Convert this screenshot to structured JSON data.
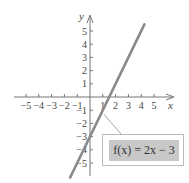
{
  "chart_data": {
    "type": "line",
    "title": "",
    "xlabel": "x",
    "ylabel": "y",
    "xlim": [
      -5.8,
      6
    ],
    "ylim": [
      -6.2,
      6.2
    ],
    "x_ticks": [
      -5,
      -4,
      -3,
      -2,
      -1,
      1,
      2,
      3,
      4,
      5
    ],
    "y_ticks": [
      5,
      4,
      3,
      2,
      1,
      -1,
      -2,
      -3,
      -4,
      -5
    ],
    "grid": false,
    "series": [
      {
        "name": "f(x) = 2x - 3",
        "equation": "f(x) = 2x - 3",
        "slope": 2,
        "intercept": -3,
        "x": [
          -1.55,
          4.25
        ],
        "values": [
          -6.1,
          5.5
        ],
        "color": "#8a8a8a"
      }
    ],
    "annotations": [
      {
        "text": "f(x) = 2x − 3",
        "points_to": [
          1,
          -1
        ]
      }
    ]
  },
  "labels": {
    "x_axis": "x",
    "y_axis": "y",
    "function": "f(x) = 2x − 3"
  }
}
